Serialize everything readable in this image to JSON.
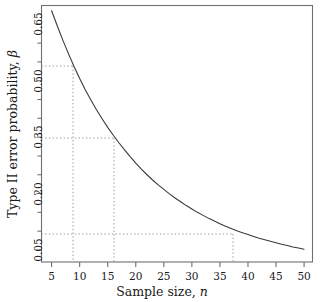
{
  "chart_data": {
    "type": "line",
    "title": "",
    "xlabel": "Sample size, n",
    "ylabel": "Type II error probability, β",
    "xlim": [
      3.2,
      51.5
    ],
    "ylim": [
      0.018,
      0.7
    ],
    "grid": false,
    "legend": null,
    "x_ticks": [
      5,
      10,
      15,
      20,
      25,
      30,
      35,
      40,
      45,
      50
    ],
    "x_tick_labels": [
      "5",
      "10",
      "15",
      "20",
      "25",
      "30",
      "35",
      "40",
      "45",
      "50"
    ],
    "x_minor_ticks": [],
    "y_ticks": [
      0.05,
      0.2,
      0.35,
      0.5,
      0.65
    ],
    "y_tick_labels": [
      "0.05",
      "0.20",
      "0.35",
      "0.50",
      "0.65"
    ],
    "y_minor_ticks": [
      0.1,
      0.15,
      0.25,
      0.3,
      0.4,
      0.45,
      0.55,
      0.6
    ],
    "line_color": "#3a3a3a",
    "line_width": 1.1,
    "guide_color": "#9a9a9a",
    "x": [
      5,
      6,
      7,
      8,
      9,
      10,
      11,
      12,
      13,
      14,
      15,
      16,
      17,
      18,
      19,
      20,
      21,
      22,
      23,
      24,
      25,
      26,
      27,
      28,
      29,
      30,
      31,
      32,
      33,
      34,
      35,
      36,
      37,
      38,
      39,
      40,
      41,
      42,
      43,
      44,
      45,
      46,
      47,
      48,
      49,
      50
    ],
    "y": [
      0.686,
      0.646,
      0.608,
      0.572,
      0.538,
      0.506,
      0.476,
      0.449,
      0.423,
      0.399,
      0.376,
      0.355,
      0.335,
      0.316,
      0.298,
      0.281,
      0.265,
      0.25,
      0.236,
      0.223,
      0.211,
      0.199,
      0.188,
      0.178,
      0.168,
      0.159,
      0.15,
      0.142,
      0.134,
      0.127,
      0.12,
      0.113,
      0.107,
      0.101,
      0.096,
      0.091,
      0.086,
      0.081,
      0.077,
      0.073,
      0.069,
      0.065,
      0.062,
      0.058,
      0.055,
      0.052
    ],
    "annotations": [
      {
        "name": "guide-n9",
        "x": 9,
        "y": 0.538,
        "label": ""
      },
      {
        "name": "guide-n16",
        "x": 16,
        "y": 0.355,
        "label": ""
      },
      {
        "name": "guide-n36",
        "x": 36,
        "y": 0.09,
        "label": ""
      }
    ]
  },
  "axis": {
    "x_title": "Sample size, n",
    "x_title_text": "Sample size,",
    "x_title_var": "n",
    "y_title_text": "Type II error probability,",
    "y_title_var": "β"
  }
}
